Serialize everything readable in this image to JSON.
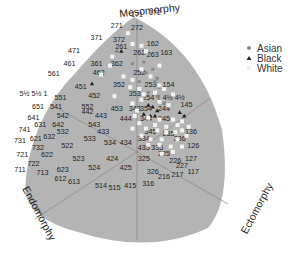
{
  "chart_data": {
    "type": "scatter",
    "axis_titles": {
      "top": "Mesomorphy",
      "left": "Endomorphy",
      "right": "Ectomorphy"
    },
    "legend": {
      "placement": "top-right",
      "entries": [
        {
          "label": "Asian",
          "marker": "circle",
          "color": "#8a8a8a"
        },
        {
          "label": "Black",
          "marker": "triangle",
          "color": "#222222"
        },
        {
          "label": "White",
          "marker": "square",
          "color": "#f2f2f2"
        }
      ]
    },
    "colors": {
      "background_region": "#b4b4b4",
      "guide_lines": "#8c8c8c",
      "label_text": "#222222"
    },
    "grid_labels": [
      {
        "t": "171",
        "x": 0.0,
        "y": 7.5
      },
      {
        "t": "172",
        "x": 0.8,
        "y": 7.6
      },
      {
        "t": "271",
        "x": -0.9,
        "y": 6.9
      },
      {
        "t": "272",
        "x": 0.0,
        "y": 6.8
      },
      {
        "t": "371",
        "x": -1.8,
        "y": 6.2
      },
      {
        "t": "372",
        "x": -0.8,
        "y": 6.1
      },
      {
        "t": "471",
        "x": -2.8,
        "y": 5.5
      },
      {
        "t": "261",
        "x": -0.7,
        "y": 5.7
      },
      {
        "t": "262",
        "x": 0.1,
        "y": 5.4
      },
      {
        "t": "162",
        "x": 0.7,
        "y": 5.9
      },
      {
        "t": "461",
        "x": -3.0,
        "y": 4.8
      },
      {
        "t": "361",
        "x": -1.8,
        "y": 4.8
      },
      {
        "t": "362",
        "x": -0.9,
        "y": 4.8
      },
      {
        "t": "263",
        "x": 0.7,
        "y": 5.3
      },
      {
        "t": "163",
        "x": 1.3,
        "y": 5.4
      },
      {
        "t": "561",
        "x": -3.7,
        "y": 4.2
      },
      {
        "t": "462",
        "x": -1.7,
        "y": 4.3
      },
      {
        "t": "252",
        "x": 0.1,
        "y": 4.3
      },
      {
        "t": "451",
        "x": -2.5,
        "y": 3.5
      },
      {
        "t": "352",
        "x": -0.8,
        "y": 3.6
      },
      {
        "t": "253",
        "x": 0.6,
        "y": 3.6
      },
      {
        "t": "154",
        "x": 1.4,
        "y": 3.6
      },
      {
        "t": "5½ 5½ 1",
        "x": -4.6,
        "y": 3.1
      },
      {
        "t": "551",
        "x": -3.4,
        "y": 2.9
      },
      {
        "t": "452",
        "x": -1.9,
        "y": 3.0
      },
      {
        "t": "353",
        "x": -0.1,
        "y": 3.1
      },
      {
        "t": "254",
        "x": 0.5,
        "y": 2.9
      },
      {
        "t": "1 4½ 4½",
        "x": 1.5,
        "y": 2.9
      },
      {
        "t": "651",
        "x": -4.4,
        "y": 2.4
      },
      {
        "t": "541",
        "x": -3.6,
        "y": 2.4
      },
      {
        "t": "552",
        "x": -2.2,
        "y": 2.4
      },
      {
        "t": "453",
        "x": -0.9,
        "y": 2.3
      },
      {
        "t": "343",
        "x": -0.1,
        "y": 2.3
      },
      {
        "t": "354",
        "x": 0.4,
        "y": 2.3
      },
      {
        "t": "244",
        "x": 1.2,
        "y": 2.3
      },
      {
        "t": "145",
        "x": 2.2,
        "y": 2.5
      },
      {
        "t": "641",
        "x": -4.6,
        "y": 1.8
      },
      {
        "t": "542",
        "x": -3.3,
        "y": 1.9
      },
      {
        "t": "442",
        "x": -2.2,
        "y": 2.1
      },
      {
        "t": "443",
        "x": -1.6,
        "y": 1.9
      },
      {
        "t": "444",
        "x": -0.5,
        "y": 1.7
      },
      {
        "t": "344",
        "x": 0.4,
        "y": 1.7
      },
      {
        "t": "245",
        "x": 1.2,
        "y": 1.7
      },
      {
        "t": "631",
        "x": -4.3,
        "y": 1.4
      },
      {
        "t": "642",
        "x": -3.5,
        "y": 1.4
      },
      {
        "t": "543",
        "x": -1.9,
        "y": 1.4
      },
      {
        "t": "741",
        "x": -5.0,
        "y": 1.1
      },
      {
        "t": "532",
        "x": -3.3,
        "y": 1.0
      },
      {
        "t": "433",
        "x": -1.5,
        "y": 1.0
      },
      {
        "t": "345",
        "x": 0.6,
        "y": 1.0
      },
      {
        "t": "235",
        "x": 1.4,
        "y": 0.9
      },
      {
        "t": "136",
        "x": 2.4,
        "y": 1.0
      },
      {
        "t": "731",
        "x": -5.2,
        "y": 0.5
      },
      {
        "t": "621",
        "x": -4.5,
        "y": 0.6
      },
      {
        "t": "632",
        "x": -3.9,
        "y": 0.7
      },
      {
        "t": "533",
        "x": -2.1,
        "y": 0.6
      },
      {
        "t": "534",
        "x": -1.2,
        "y": 0.4
      },
      {
        "t": "434",
        "x": -0.5,
        "y": 0.4
      },
      {
        "t": "334",
        "x": 0.3,
        "y": 0.6
      },
      {
        "t": "236",
        "x": 1.9,
        "y": 0.6
      },
      {
        "t": "732",
        "x": -4.4,
        "y": 0.1
      },
      {
        "t": "522",
        "x": -3.1,
        "y": 0.2
      },
      {
        "t": "435",
        "x": 0.3,
        "y": 0.1
      },
      {
        "t": "335",
        "x": 0.9,
        "y": 0.1
      },
      {
        "t": "126",
        "x": 2.5,
        "y": 0.2
      },
      {
        "t": "721",
        "x": -5.1,
        "y": -0.3
      },
      {
        "t": "622",
        "x": -4.0,
        "y": -0.3
      },
      {
        "t": "523",
        "x": -2.6,
        "y": -0.5
      },
      {
        "t": "424",
        "x": -1.1,
        "y": -0.5
      },
      {
        "t": "225",
        "x": 1.2,
        "y": -0.2
      },
      {
        "t": "722",
        "x": -4.6,
        "y": -0.8
      },
      {
        "t": "524",
        "x": -1.9,
        "y": -1.0
      },
      {
        "t": "325",
        "x": 0.3,
        "y": -0.5
      },
      {
        "t": "425",
        "x": -0.5,
        "y": -1.0
      },
      {
        "t": "226",
        "x": 1.7,
        "y": -0.6
      },
      {
        "t": "127",
        "x": 2.4,
        "y": -0.5
      },
      {
        "t": "711",
        "x": -5.2,
        "y": -1.1
      },
      {
        "t": "713",
        "x": -4.2,
        "y": -1.3
      },
      {
        "t": "623",
        "x": -3.3,
        "y": -1.1
      },
      {
        "t": "326",
        "x": 0.7,
        "y": -1.2
      },
      {
        "t": "227",
        "x": 2.0,
        "y": -0.9
      },
      {
        "t": "117",
        "x": 2.5,
        "y": -1.2
      },
      {
        "t": "612",
        "x": -3.4,
        "y": -1.6
      },
      {
        "t": "613",
        "x": -2.8,
        "y": -1.8
      },
      {
        "t": "216",
        "x": 1.2,
        "y": -1.5
      },
      {
        "t": "217",
        "x": 1.8,
        "y": -1.4
      },
      {
        "t": "514",
        "x": -1.6,
        "y": -2.0
      },
      {
        "t": "515",
        "x": -1.0,
        "y": -2.1
      },
      {
        "t": "415",
        "x": -0.3,
        "y": -2.0
      },
      {
        "t": "316",
        "x": 0.5,
        "y": -1.9
      }
    ],
    "series": [
      {
        "name": "Asian",
        "points": [
          {
            "x": -0.9,
            "y": 5.6
          },
          {
            "x": -0.2,
            "y": 4.9
          },
          {
            "x": 0.3,
            "y": 5.0
          },
          {
            "x": 0.4,
            "y": 4.4
          },
          {
            "x": 0.9,
            "y": 4.1
          },
          {
            "x": 0.8,
            "y": 3.9
          },
          {
            "x": 0.5,
            "y": 3.3
          },
          {
            "x": 0.9,
            "y": 3.1
          },
          {
            "x": 1.2,
            "y": 2.7
          },
          {
            "x": 0.1,
            "y": 3.9
          },
          {
            "x": 0.7,
            "y": 4.6
          },
          {
            "x": 1.0,
            "y": 3.6
          }
        ]
      },
      {
        "name": "Black",
        "points": [
          {
            "x": -0.7,
            "y": 5.6
          },
          {
            "x": -2.0,
            "y": 3.8
          },
          {
            "x": 0.5,
            "y": 2.6
          },
          {
            "x": 0.7,
            "y": 2.5
          },
          {
            "x": 0.3,
            "y": 2.1
          },
          {
            "x": 0.8,
            "y": 2.0
          },
          {
            "x": 0.9,
            "y": 2.3
          },
          {
            "x": 1.9,
            "y": 2.2
          },
          {
            "x": 2.1,
            "y": 2.0
          },
          {
            "x": 0.6,
            "y": 2.0
          }
        ]
      },
      {
        "name": "White",
        "points": [
          {
            "x": -0.4,
            "y": 6.6
          },
          {
            "x": -0.2,
            "y": 6.0
          },
          {
            "x": -1.1,
            "y": 5.3
          },
          {
            "x": -1.2,
            "y": 4.8
          },
          {
            "x": -1.6,
            "y": 4.3
          },
          {
            "x": -0.6,
            "y": 4.2
          },
          {
            "x": -0.2,
            "y": 4.0
          },
          {
            "x": -0.3,
            "y": 3.6
          },
          {
            "x": -1.0,
            "y": 3.1
          },
          {
            "x": -0.2,
            "y": 2.7
          },
          {
            "x": 0.2,
            "y": 2.9
          },
          {
            "x": 0.1,
            "y": 3.5
          },
          {
            "x": 0.2,
            "y": 4.6
          },
          {
            "x": 0.4,
            "y": 5.6
          },
          {
            "x": 0.2,
            "y": 5.9
          },
          {
            "x": 1.0,
            "y": 4.8
          },
          {
            "x": 0.6,
            "y": 4.2
          },
          {
            "x": 1.0,
            "y": 3.7
          },
          {
            "x": 0.3,
            "y": 3.2
          },
          {
            "x": 0.8,
            "y": 3.3
          },
          {
            "x": 1.2,
            "y": 3.5
          },
          {
            "x": 1.6,
            "y": 3.2
          },
          {
            "x": 1.0,
            "y": 2.8
          },
          {
            "x": 1.4,
            "y": 2.6
          },
          {
            "x": -0.1,
            "y": 2.0
          },
          {
            "x": 0.1,
            "y": 1.6
          },
          {
            "x": 0.4,
            "y": 1.3
          },
          {
            "x": 0.8,
            "y": 1.5
          },
          {
            "x": 0.9,
            "y": 1.2
          },
          {
            "x": 1.0,
            "y": 1.8
          },
          {
            "x": 1.3,
            "y": 1.4
          },
          {
            "x": 1.6,
            "y": 1.8
          },
          {
            "x": 1.8,
            "y": 1.5
          },
          {
            "x": 2.0,
            "y": 1.7
          },
          {
            "x": 2.3,
            "y": 1.4
          },
          {
            "x": 0.2,
            "y": 0.9
          },
          {
            "x": 0.6,
            "y": 0.7
          },
          {
            "x": 1.1,
            "y": 0.7
          },
          {
            "x": 1.3,
            "y": 1.1
          },
          {
            "x": 1.7,
            "y": 1.1
          },
          {
            "x": 2.0,
            "y": 1.2
          },
          {
            "x": 2.2,
            "y": 0.9
          },
          {
            "x": 0.5,
            "y": 0.4
          },
          {
            "x": 1.0,
            "y": 0.4
          },
          {
            "x": 1.5,
            "y": 0.3
          },
          {
            "x": 2.0,
            "y": 0.3
          },
          {
            "x": 1.1,
            "y": -0.1
          },
          {
            "x": 1.6,
            "y": 0.0
          },
          {
            "x": 0.0,
            "y": 2.3
          },
          {
            "x": 0.5,
            "y": 1.9
          },
          {
            "x": -0.2,
            "y": 1.3
          },
          {
            "x": 1.8,
            "y": 0.7
          }
        ]
      }
    ],
    "xlim": [
      -6,
      3
    ],
    "ylim": [
      -2.5,
      8
    ],
    "grid": false
  }
}
